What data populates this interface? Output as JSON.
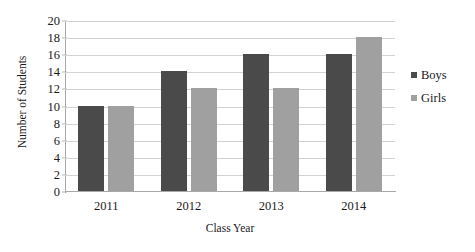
{
  "chart_data": {
    "type": "bar",
    "title": "",
    "xlabel": "Class Year",
    "ylabel": "Number of Students",
    "categories": [
      "2011",
      "2012",
      "2013",
      "2014"
    ],
    "series": [
      {
        "name": "Boys",
        "color": "#4a4a4a",
        "values": [
          10,
          14,
          16,
          16
        ]
      },
      {
        "name": "Girls",
        "color": "#a0a0a0",
        "values": [
          10,
          12,
          12,
          18
        ]
      }
    ],
    "ylim": [
      0,
      20
    ],
    "ytick_step": 2,
    "yticks": [
      0,
      2,
      4,
      6,
      8,
      10,
      12,
      14,
      16,
      18,
      20
    ],
    "grid": true,
    "legend_position": "right"
  },
  "legend": {
    "items": [
      {
        "label": "Boys",
        "swatch": "#4a4a4a"
      },
      {
        "label": "Girls",
        "swatch": "#a0a0a0"
      }
    ]
  },
  "axes": {
    "y_title": "Number of Students",
    "x_title": "Class Year"
  }
}
